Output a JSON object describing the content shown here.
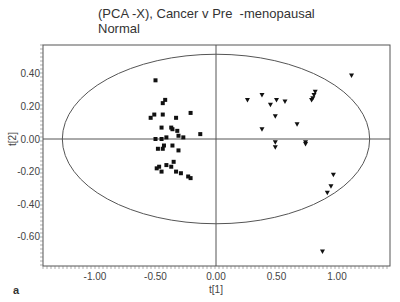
{
  "chart_data": {
    "type": "scatter",
    "title": "(PCA -X), Cancer v Pre  -menopausal\nNormal",
    "panel_label": "a",
    "xlabel": "t[1]",
    "ylabel": "t[2]",
    "xlim": [
      -1.4,
      1.3
    ],
    "ylim": [
      -0.77,
      0.56
    ],
    "xticks": [
      "-1.00",
      "-0.50",
      "0.00",
      "0.50",
      "1.00"
    ],
    "yticks": [
      "0.40",
      "0.20",
      "0.00",
      "-0.20",
      "-0.40",
      "-0.60"
    ],
    "grid": false,
    "hotelling_ellipse": {
      "cx": 0.0,
      "cy": 0.0,
      "rx": 1.27,
      "ry": 0.52
    },
    "series": [
      {
        "name": "Cancer",
        "marker": "square",
        "points": [
          [
            -0.5,
            0.36
          ],
          [
            -0.44,
            0.22
          ],
          [
            -0.42,
            0.24
          ],
          [
            -0.54,
            0.13
          ],
          [
            -0.51,
            0.15
          ],
          [
            -0.44,
            0.15
          ],
          [
            -0.45,
            0.07
          ],
          [
            -0.33,
            0.13
          ],
          [
            -0.36,
            0.06
          ],
          [
            -0.37,
            0.07
          ],
          [
            -0.32,
            0.05
          ],
          [
            -0.31,
            0.02
          ],
          [
            -0.21,
            0.16
          ],
          [
            -0.13,
            0.03
          ],
          [
            -0.5,
            0.0
          ],
          [
            -0.45,
            0.0
          ],
          [
            -0.41,
            0.01
          ],
          [
            -0.27,
            0.01
          ],
          [
            -0.48,
            -0.06
          ],
          [
            -0.44,
            -0.06
          ],
          [
            -0.43,
            -0.04
          ],
          [
            -0.31,
            -0.07
          ],
          [
            -0.41,
            -0.16
          ],
          [
            -0.37,
            -0.17
          ],
          [
            -0.35,
            -0.14
          ],
          [
            -0.49,
            -0.18
          ],
          [
            -0.45,
            -0.2
          ],
          [
            -0.33,
            -0.2
          ],
          [
            -0.29,
            -0.21
          ],
          [
            -0.23,
            -0.23
          ],
          [
            -0.21,
            -0.24
          ],
          [
            -0.36,
            -0.04
          ],
          [
            -0.47,
            -0.17
          ]
        ]
      },
      {
        "name": "Pre-menopausal Normal",
        "marker": "triangle-down",
        "points": [
          [
            0.38,
            0.27
          ],
          [
            0.45,
            0.21
          ],
          [
            0.5,
            0.24
          ],
          [
            0.57,
            0.23
          ],
          [
            0.49,
            0.14
          ],
          [
            0.67,
            0.09
          ],
          [
            0.38,
            0.06
          ],
          [
            0.49,
            -0.02
          ],
          [
            0.49,
            -0.05
          ],
          [
            0.74,
            -0.03
          ],
          [
            0.81,
            0.27
          ],
          [
            0.82,
            0.29
          ],
          [
            0.79,
            0.24
          ],
          [
            0.8,
            0.25
          ],
          [
            1.12,
            0.39
          ],
          [
            0.74,
            -0.02
          ],
          [
            0.97,
            -0.22
          ],
          [
            0.95,
            -0.29
          ],
          [
            0.92,
            -0.33
          ],
          [
            0.88,
            -0.69
          ],
          [
            0.26,
            0.24
          ]
        ]
      }
    ]
  }
}
